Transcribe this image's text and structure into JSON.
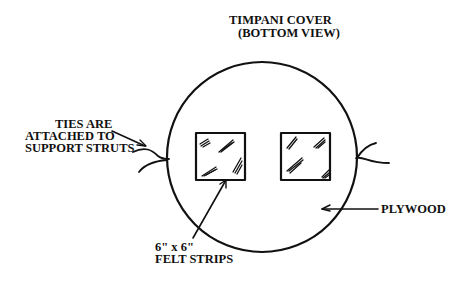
{
  "diagram": {
    "title_line1": "TIMPANI COVER",
    "title_line2": "(BOTTOM VIEW)",
    "labels": {
      "ties_line1": "TIES ARE",
      "ties_line2": "ATTACHED TO",
      "ties_line3": "SUPPORT STRUTS",
      "felt_line1": "6\" x 6\"",
      "felt_line2": "FELT STRIPS",
      "plywood": "PLYWOOD"
    },
    "colors": {
      "ink": "#111111",
      "background": "#ffffff"
    }
  }
}
